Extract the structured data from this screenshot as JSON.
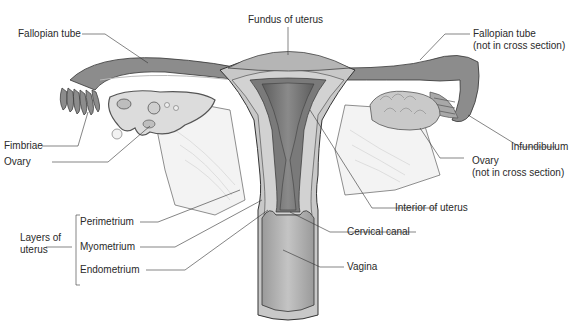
{
  "diagram": {
    "labels": {
      "fallopian_tube_left": "Fallopian tube",
      "fundus": "Fundus of uterus",
      "fallopian_tube_right_line1": "Fallopian tube",
      "fallopian_tube_right_line2": "(not in cross section)",
      "fimbriae": "Fimbriae",
      "ovary_left": "Ovary",
      "infundibulum": "Infundibulum",
      "ovary_right_line1": "Ovary",
      "ovary_right_line2": "(not in cross section)",
      "interior_of_uterus": "Interior of uterus",
      "layers_line1": "Layers of",
      "layers_line2": "uterus",
      "perimetrium": "Perimetrium",
      "myometrium": "Myometrium",
      "endometrium": "Endometrium",
      "cervical_canal": "Cervical canal",
      "vagina": "Vagina"
    },
    "colors": {
      "tube_dark": "#8c8c8c",
      "tissue_mid": "#b8b8b8",
      "tissue_light": "#d9d9d9",
      "cavity_dark": "#6f6f6f",
      "line": "#333333"
    }
  }
}
